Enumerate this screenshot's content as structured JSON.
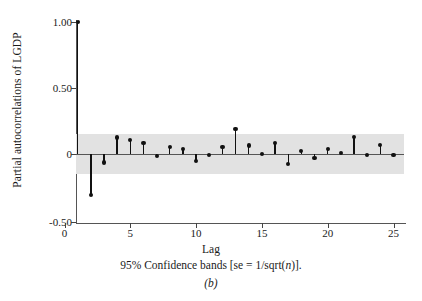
{
  "chart_data": {
    "type": "bar",
    "title": "",
    "subtitle": "",
    "xlabel": "Lag",
    "ylabel": "Partial autocorrelations of LGDP",
    "caption": "95% Confidence bands [se = 1/sqrt(n)].",
    "panel_label": "(b)",
    "xlim": [
      0,
      25.6
    ],
    "ylim": [
      -0.5,
      1.05
    ],
    "xticks": [
      0,
      5,
      10,
      15,
      20,
      25
    ],
    "xtick_labels": [
      "0",
      "5",
      "10",
      "15",
      "20",
      "25"
    ],
    "yticks": [
      -0.5,
      0,
      0.5,
      1.0
    ],
    "ytick_labels": [
      "-0.50",
      "0",
      "0.50",
      "1.00"
    ],
    "grid": false,
    "legend": "none",
    "confidence_band": {
      "label": "95% confidence band",
      "upper": 0.15,
      "lower": -0.15,
      "color": "#e2e2e2"
    },
    "series_name": "Partial autocorrelation",
    "marker_color": "#111111",
    "categories": [
      1,
      2,
      3,
      4,
      5,
      6,
      7,
      8,
      9,
      10,
      11,
      12,
      13,
      14,
      15,
      16,
      17,
      18,
      19,
      20,
      21,
      22,
      23,
      24,
      25
    ],
    "values": [
      1.0,
      -0.31,
      -0.065,
      0.125,
      0.105,
      0.085,
      -0.015,
      0.05,
      0.04,
      -0.05,
      -0.01,
      0.05,
      0.19,
      0.065,
      0.0,
      0.085,
      -0.075,
      0.02,
      -0.03,
      0.035,
      0.005,
      0.13,
      -0.005,
      0.07,
      -0.005
    ]
  },
  "figure": {
    "caption_prefix": "95% Confidence bands [se = 1/sqrt(",
    "caption_italic": "n",
    "caption_suffix": ")].",
    "panel_letter": "(b)"
  }
}
